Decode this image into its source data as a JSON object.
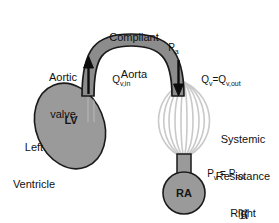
{
  "figure": {
    "background_color": "#ffffff",
    "vessel_fill": "#8c8c8c",
    "vessel_stroke": "#1a1a1a",
    "chamber_fill": "#9a9a9a",
    "resistance_stroke": "#c9c9c9",
    "text_color": "#111111"
  },
  "labels": {
    "compliant_aorta_line1": "Compliant",
    "compliant_aorta_line2": "Aorta",
    "aortic_valve_line1": "Aortic",
    "aortic_valve_line2": "valve",
    "left_ventricle_line1": "Left",
    "left_ventricle_line2": "Ventricle",
    "lv_inner": "LV",
    "systemic_resistance_line1": "Systemic",
    "systemic_resistance_line2": "Resistance",
    "systemic_resistance_symbol": "ℜ",
    "right_atrium_line1": "Right",
    "right_atrium_line2": "Atrium",
    "ra_inner": "RA"
  },
  "math": {
    "p_a_base": "P",
    "p_a_sub": "a",
    "q_in_base": "Q",
    "q_in_sub": "v,in",
    "q_out_base1": "Q",
    "q_out_sub1": "v",
    "q_out_eq": "=Q",
    "q_out_sub2": "v,out",
    "p_v_base": "P",
    "p_v_sub": "v",
    "p_v_eq": " = P",
    "p_ra_sub": "RA"
  },
  "arrows": {
    "inflow_direction": "up",
    "inflow_name": "aortic-valve-inflow-arrow",
    "outflow_direction": "down",
    "outflow_name": "systemic-outflow-arrow"
  }
}
